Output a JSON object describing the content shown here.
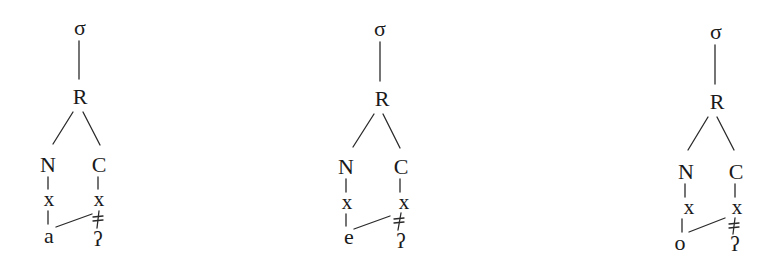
{
  "diagram": {
    "colors": {
      "background": "#ffffff",
      "ink": "#1a1a1a"
    },
    "trees": [
      {
        "syllable": "σ",
        "rhyme": "R",
        "nucleus": "N",
        "coda": "C",
        "nucleus_slot": "x",
        "coda_slot": "x",
        "vowel": "a",
        "coda_segment": "ʔ",
        "delinked": true,
        "spread_link": "vowel-to-coda-slot"
      },
      {
        "syllable": "σ",
        "rhyme": "R",
        "nucleus": "N",
        "coda": "C",
        "nucleus_slot": "x",
        "coda_slot": "x",
        "vowel": "e",
        "coda_segment": "ʔ",
        "delinked": true,
        "spread_link": "vowel-to-coda-slot"
      },
      {
        "syllable": "σ",
        "rhyme": "R",
        "nucleus": "N",
        "coda": "C",
        "nucleus_slot": "x",
        "coda_slot": "x",
        "vowel": "o",
        "coda_segment": "ʔ",
        "delinked": true,
        "spread_link": "vowel-to-coda-slot"
      }
    ]
  }
}
